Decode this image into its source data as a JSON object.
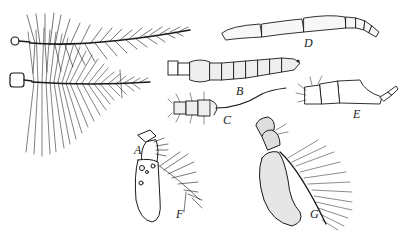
{
  "figure": {
    "ink_color": "#1a1a1a",
    "background": "#ffffff",
    "panels": [
      {
        "id": "A",
        "label": "A",
        "subject": "plumose antennae (two, bushy feathered)"
      },
      {
        "id": "B",
        "label": "B",
        "subject": "segmented bead-like antenna with short hairs"
      },
      {
        "id": "C",
        "label": "C",
        "subject": "short segmented antenna with long thin terminal arista"
      },
      {
        "id": "D",
        "label": "D",
        "subject": "elongated segmented antenna tapering at tip"
      },
      {
        "id": "E",
        "label": "E",
        "subject": "lamellate / clubbed antenna with tapered tip"
      },
      {
        "id": "F",
        "label": "F",
        "subject": "oval basal segment with feathery arista"
      },
      {
        "id": "G",
        "label": "G",
        "subject": "stippled basal segment with pectinate fringe"
      }
    ]
  }
}
